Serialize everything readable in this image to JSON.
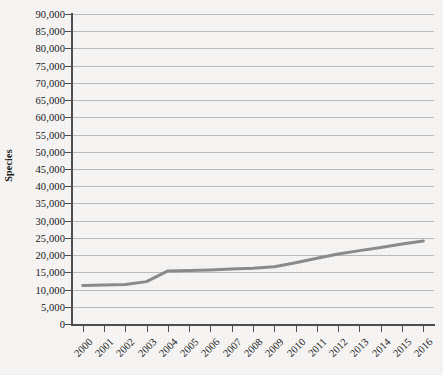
{
  "chart_data": {
    "type": "line",
    "title": "",
    "subtitle": "",
    "xlabel": "",
    "ylabel": "Species",
    "categories": [
      "2000",
      "2001",
      "2002",
      "2003",
      "2004",
      "2005",
      "2006",
      "2007",
      "2008",
      "2009",
      "2010",
      "2011",
      "2012",
      "2013",
      "2014",
      "2015",
      "2016"
    ],
    "x": [
      2000,
      2001,
      2002,
      2003,
      2004,
      2005,
      2006,
      2007,
      2008,
      2009,
      2010,
      2011,
      2012,
      2013,
      2014,
      2015,
      2016
    ],
    "values": [
      11200,
      11300,
      11500,
      12300,
      15400,
      15500,
      15700,
      16000,
      16200,
      16600,
      17800,
      19100,
      20300,
      21300,
      22200,
      23200,
      24100
    ],
    "series": [
      {
        "name": "Species",
        "color": "#8a8a8c",
        "values": [
          11200,
          11300,
          11500,
          12300,
          15400,
          15500,
          15700,
          16000,
          16200,
          16600,
          17800,
          19100,
          20300,
          21300,
          22200,
          23200,
          24100
        ]
      }
    ],
    "ylim": [
      0,
      90000
    ],
    "ytick_step": 5000,
    "ytick_labels": [
      "0",
      "5,000",
      "10,000",
      "15,000",
      "20,000",
      "25,000",
      "30,000",
      "35,000",
      "40,000",
      "45,000",
      "50,000",
      "55,000",
      "60,000",
      "65,000",
      "70,000",
      "75,000",
      "80,000",
      "85,000",
      "90,000"
    ],
    "ytick_values": [
      0,
      5000,
      10000,
      15000,
      20000,
      25000,
      30000,
      35000,
      40000,
      45000,
      50000,
      55000,
      60000,
      65000,
      70000,
      75000,
      80000,
      85000,
      90000
    ],
    "grid": true,
    "grid_axis": "y",
    "legend": false,
    "legend_position": "none",
    "markers": false,
    "line_width": 3,
    "colors": {
      "background": "#f6f5f3",
      "grid": "#b9b9bb",
      "axis": "#4e4e52",
      "series": "#8a8a8c",
      "text": "#15151a"
    },
    "annotations": []
  }
}
